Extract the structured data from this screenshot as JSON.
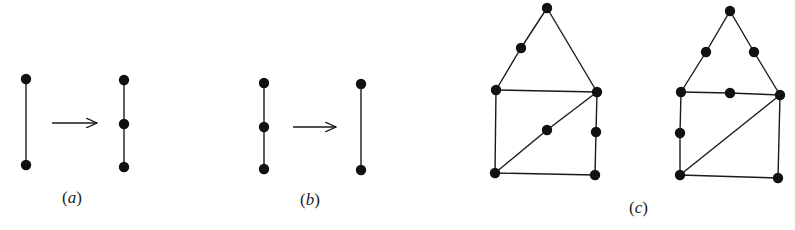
{
  "figure": {
    "panels": [
      {
        "id": "a",
        "label": "(a)",
        "description": "Subdivision: an edge gets a new degree-2 vertex inserted",
        "before": {
          "nodes": [
            [
              26,
              79
            ],
            [
              26,
              165
            ]
          ],
          "edges": [
            [
              0,
              1
            ]
          ]
        },
        "after": {
          "nodes": [
            [
              124,
              80
            ],
            [
              124,
              124
            ],
            [
              124,
              167
            ]
          ],
          "edges": [
            [
              0,
              1
            ],
            [
              1,
              2
            ]
          ]
        },
        "arrow": {
          "x1": 52,
          "x2": 97,
          "y": 123
        }
      },
      {
        "id": "b",
        "label": "(b)",
        "description": "Smoothing: a degree-2 vertex is removed, merging two edges",
        "before": {
          "nodes": [
            [
              264,
              83
            ],
            [
              264,
              127
            ],
            [
              264,
              169
            ]
          ],
          "edges": [
            [
              0,
              1
            ],
            [
              1,
              2
            ]
          ]
        },
        "after": {
          "nodes": [
            [
              361,
              84
            ],
            [
              361,
              170
            ]
          ],
          "edges": [
            [
              0,
              1
            ]
          ]
        },
        "arrow": {
          "x1": 293,
          "x2": 336,
          "y": 127
        }
      },
      {
        "id": "c",
        "label": "(c)",
        "description": "Two homeomorphic house-shaped graphs",
        "graphs": [
          {
            "nodes": [
              [
                547,
                8
              ],
              [
                521,
                48
              ],
              [
                496,
                90
              ],
              [
                597,
                92
              ],
              [
                547,
                130
              ],
              [
                596,
                132
              ],
              [
                495,
                173
              ],
              [
                595,
                175
              ]
            ],
            "edges": [
              [
                0,
                1
              ],
              [
                1,
                2
              ],
              [
                0,
                3
              ],
              [
                2,
                3
              ],
              [
                2,
                6
              ],
              [
                6,
                7
              ],
              [
                7,
                5
              ],
              [
                5,
                3
              ],
              [
                6,
                4
              ],
              [
                4,
                3
              ]
            ]
          },
          {
            "nodes": [
              [
                730,
                11
              ],
              [
                706,
                52
              ],
              [
                754,
                52
              ],
              [
                681,
                92
              ],
              [
                730,
                93
              ],
              [
                780,
                95
              ],
              [
                680,
                133
              ],
              [
                680,
                175
              ],
              [
                778,
                178
              ]
            ],
            "edges": [
              [
                0,
                1
              ],
              [
                1,
                3
              ],
              [
                0,
                2
              ],
              [
                2,
                5
              ],
              [
                3,
                4
              ],
              [
                4,
                5
              ],
              [
                3,
                6
              ],
              [
                6,
                7
              ],
              [
                7,
                8
              ],
              [
                8,
                5
              ],
              [
                7,
                5
              ]
            ]
          }
        ]
      }
    ],
    "labels": [
      {
        "text_open": "(",
        "letter": "a",
        "text_close": ")",
        "x": 62,
        "y": 188
      },
      {
        "text_open": "(",
        "letter": "b",
        "text_close": ")",
        "x": 300,
        "y": 190
      },
      {
        "text_open": "(",
        "letter": "c",
        "text_close": ")",
        "x": 629,
        "y": 198
      }
    ],
    "colors": {
      "ink": "#111111",
      "background": "#ffffff"
    }
  }
}
